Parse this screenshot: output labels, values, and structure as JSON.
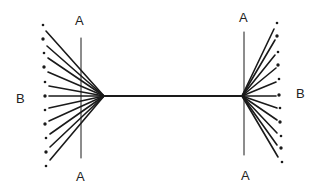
{
  "diagram": {
    "colors": {
      "line": "#1a1a1a",
      "background": "#ffffff"
    },
    "labels": {
      "left_top_A": "A",
      "left_bottom_A": "A",
      "right_top_A": "A",
      "right_bottom_A": "A",
      "left_B": "B",
      "right_B": "B"
    },
    "left_fan": {
      "convergence_point": [
        104,
        96
      ],
      "vertical_line": {
        "x": 81,
        "y1": 38,
        "y2": 158
      },
      "dots": [
        [
          43,
          25
        ],
        [
          43,
          39
        ],
        [
          44,
          53
        ],
        [
          44,
          67
        ],
        [
          45,
          82
        ],
        [
          45,
          96
        ],
        [
          45,
          110
        ],
        [
          45,
          124
        ],
        [
          46,
          138
        ],
        [
          46,
          152
        ],
        [
          46,
          166
        ]
      ],
      "line_ends": [
        [
          46,
          31
        ],
        [
          47,
          46
        ],
        [
          48,
          58
        ],
        [
          48,
          72
        ],
        [
          49,
          86
        ],
        [
          49,
          96
        ],
        [
          49,
          108
        ],
        [
          49,
          121
        ],
        [
          50,
          134
        ],
        [
          50,
          147
        ],
        [
          50,
          160
        ]
      ]
    },
    "connector": {
      "x1": 104,
      "y1": 96,
      "x2": 242,
      "y2": 96
    },
    "right_fan": {
      "convergence_point": [
        242,
        96
      ],
      "vertical_line": {
        "x": 244,
        "y1": 32,
        "y2": 155
      },
      "dots": [
        [
          277,
          23
        ],
        [
          277,
          36
        ],
        [
          278,
          52
        ],
        [
          278,
          65
        ],
        [
          279,
          79
        ],
        [
          279,
          95
        ],
        [
          280,
          108
        ],
        [
          280,
          122
        ],
        [
          281,
          136
        ],
        [
          281,
          148
        ],
        [
          282,
          162
        ]
      ],
      "line_ends": [
        [
          274,
          29
        ],
        [
          275,
          40
        ],
        [
          275,
          55
        ],
        [
          276,
          68
        ],
        [
          276,
          82
        ],
        [
          276,
          96
        ],
        [
          277,
          108
        ],
        [
          277,
          120
        ],
        [
          277,
          133
        ],
        [
          277,
          145
        ],
        [
          278,
          157
        ]
      ]
    }
  }
}
